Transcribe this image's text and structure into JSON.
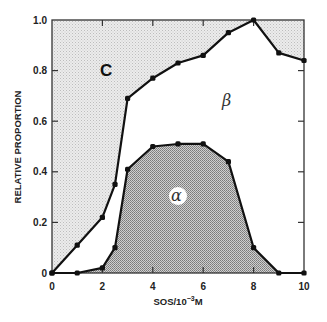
{
  "chart_data": {
    "type": "line",
    "title": "",
    "xlabel": "SOS/10⁻³M",
    "ylabel": "RELATIVE PROPORTION",
    "xlim": [
      0,
      10
    ],
    "ylim": [
      0,
      1.0
    ],
    "x_ticks": [
      "0",
      "2",
      "4",
      "6",
      "8",
      "10"
    ],
    "y_ticks": [
      "0",
      "0.2",
      "0.4",
      "0.6",
      "0.8",
      "1.0"
    ],
    "grid": false,
    "legend": null,
    "series": [
      {
        "name": "C/β boundary (upper curve)",
        "x": [
          0,
          1,
          2,
          2.5,
          3,
          4,
          5,
          6,
          7,
          8,
          9,
          10
        ],
        "y": [
          0,
          0.11,
          0.22,
          0.35,
          0.69,
          0.77,
          0.83,
          0.86,
          0.95,
          1.0,
          0.87,
          0.84
        ],
        "fill_above": "light stipple (region C)"
      },
      {
        "name": "α fraction (lower curve)",
        "x": [
          0,
          1,
          2,
          2.5,
          3,
          4,
          5,
          6,
          7,
          8,
          9,
          10
        ],
        "y": [
          0,
          0,
          0.02,
          0.1,
          0.41,
          0.5,
          0.51,
          0.51,
          0.44,
          0.1,
          0,
          0
        ],
        "fill_below": "dark stipple (region α)"
      }
    ],
    "annotations": [
      {
        "text": "C",
        "x": 1.9,
        "y": 0.82
      },
      {
        "text": "β",
        "x": 6.8,
        "y": 0.66
      },
      {
        "text": "α",
        "x": 5.0,
        "y": 0.3
      }
    ]
  },
  "labels": {
    "xlabel": "SOS/10",
    "xlabel_sup": "−3",
    "xlabel_unit": "M",
    "ylabel": "RELATIVE PROPORTION",
    "region_c": "C",
    "region_beta": "β",
    "region_alpha": "α"
  },
  "colors": {
    "line": "#111111",
    "fill_C": "#e2e2e2",
    "fill_alpha": "#a9a9a9",
    "background": "#ffffff"
  }
}
